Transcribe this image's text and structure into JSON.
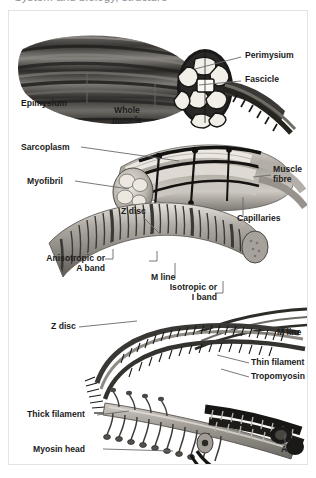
{
  "page": {
    "title_clipped": "System and biology, structure",
    "background_color": "#ffffff",
    "frame_border_color": "#e3e3e6"
  },
  "figure": {
    "name": "skeletal-muscle-structure-diagram",
    "label_color": "#1b1b1b",
    "leader_line_color": "#4a4a4a",
    "labels": [
      {
        "id": "perimysium",
        "text": "Perimysium",
        "side": "right",
        "x": 243,
        "y": 44
      },
      {
        "id": "fascicle",
        "text": "Fascicle",
        "side": "right",
        "x": 243,
        "y": 68
      },
      {
        "id": "epimysium",
        "text": "Epimysium",
        "side": "left",
        "x": 18,
        "y": 94
      },
      {
        "id": "whole-muscle",
        "text": "Whole\nmuscle",
        "side": "left",
        "x": 94,
        "y": 101
      },
      {
        "id": "sarcoplasm",
        "text": "Sarcoplasm",
        "side": "left",
        "x": 18,
        "y": 141
      },
      {
        "id": "myofibril",
        "text": "Myofibril",
        "side": "left",
        "x": 24,
        "y": 173
      },
      {
        "id": "muscle-fibre",
        "text": "Muscle\nfibre",
        "side": "right",
        "x": 272,
        "y": 163
      },
      {
        "id": "capillaries",
        "text": "Capillaries",
        "side": "right",
        "x": 244,
        "y": 211
      },
      {
        "id": "z-disc-upper",
        "text": "Z disc",
        "side": "top",
        "x": 120,
        "y": 202
      },
      {
        "id": "a-band",
        "text": "Anisotropic or\nA band",
        "side": "left",
        "x": 52,
        "y": 254
      },
      {
        "id": "m-line-upper",
        "text": "M line",
        "side": "mid",
        "x": 140,
        "y": 270
      },
      {
        "id": "i-band",
        "text": "Isotropic or\nI band",
        "side": "mid",
        "x": 160,
        "y": 285
      },
      {
        "id": "z-disc-lower",
        "text": "Z disc",
        "side": "left",
        "x": 50,
        "y": 318
      },
      {
        "id": "m-line-lower",
        "text": "M line",
        "side": "right",
        "x": 273,
        "y": 323
      },
      {
        "id": "thin-filament",
        "text": "Thin filament",
        "side": "right",
        "x": 249,
        "y": 354
      },
      {
        "id": "tropomyosin",
        "text": "Tropomyosin",
        "side": "right",
        "x": 249,
        "y": 368
      },
      {
        "id": "thick-filament",
        "text": "Thick filament",
        "side": "left",
        "x": 26,
        "y": 406
      },
      {
        "id": "myosin-head",
        "text": "Myosin head",
        "side": "left",
        "x": 32,
        "y": 441
      },
      {
        "id": "actin",
        "text": "Actin",
        "side": "right",
        "x": 279,
        "y": 441
      }
    ]
  }
}
